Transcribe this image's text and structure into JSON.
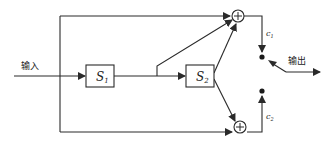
{
  "diagram": {
    "input_label": "输入",
    "output_label": "输出",
    "blocks": [
      {
        "id": "s1",
        "symbol": "S",
        "subscript": "1"
      },
      {
        "id": "s2",
        "symbol": "S",
        "subscript": "2"
      }
    ],
    "adders": [
      {
        "id": "adder-top",
        "symbol": "+"
      },
      {
        "id": "adder-bottom",
        "symbol": "+"
      }
    ],
    "outputs": [
      {
        "id": "c1",
        "symbol": "c",
        "subscript": "1"
      },
      {
        "id": "c2",
        "symbol": "c",
        "subscript": "2"
      }
    ],
    "colors": {
      "line": "#2a2a2a",
      "background": "#ffffff"
    }
  }
}
